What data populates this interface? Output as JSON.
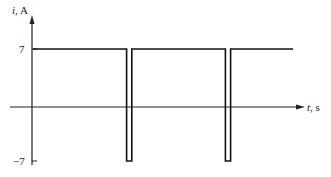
{
  "chart_data": {
    "type": "line",
    "title": "",
    "xlabel": "t, s",
    "ylabel": "i, A",
    "ylabel_var": "i",
    "ylabel_unit": ", A",
    "xlabel_var": "t",
    "xlabel_unit": ", s",
    "y_ticks": [
      7,
      -7
    ],
    "y_tick_labels": [
      "7",
      "−7"
    ],
    "ylim": [
      -7,
      7
    ],
    "grid": false,
    "legend": null,
    "series": [
      {
        "name": "i(t)",
        "points": [
          {
            "x": 0.0,
            "y": 7
          },
          {
            "x": 0.36,
            "y": 7
          },
          {
            "x": 0.36,
            "y": -7
          },
          {
            "x": 0.38,
            "y": -7
          },
          {
            "x": 0.38,
            "y": 7
          },
          {
            "x": 0.74,
            "y": 7
          },
          {
            "x": 0.74,
            "y": -7
          },
          {
            "x": 0.76,
            "y": -7
          },
          {
            "x": 0.76,
            "y": 7
          },
          {
            "x": 1.0,
            "y": 7
          }
        ]
      }
    ],
    "colors": {
      "line": "#111111",
      "axis": "#222222"
    }
  }
}
